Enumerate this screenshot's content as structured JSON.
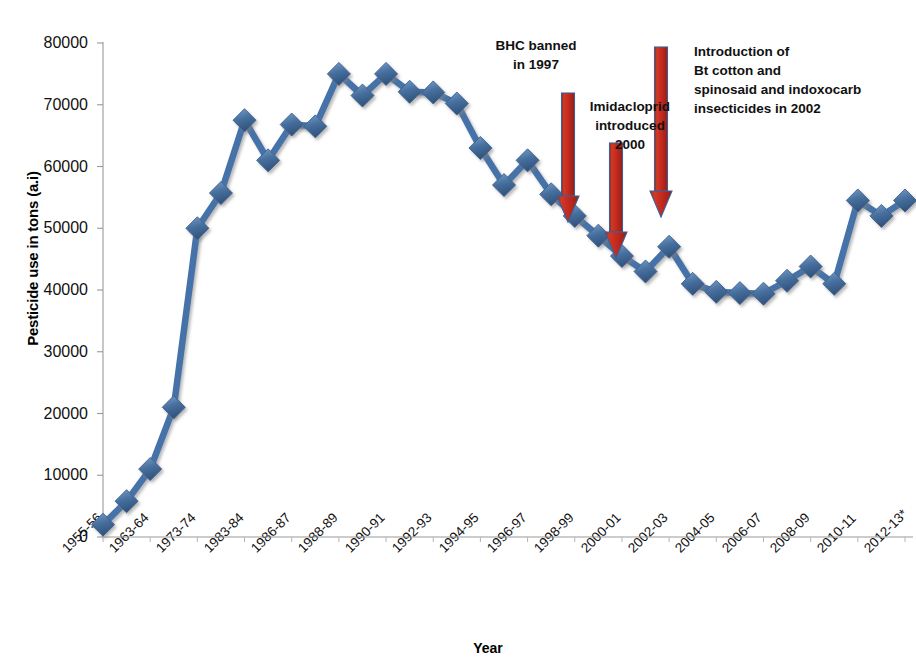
{
  "chart_data": {
    "type": "line",
    "title": "",
    "xlabel": "Year",
    "ylabel": "Pesticide use in tons (a.i)",
    "ylim": [
      0,
      80000
    ],
    "ytick_labels": [
      "0",
      "10000",
      "20000",
      "30000",
      "40000",
      "50000",
      "60000",
      "70000",
      "80000"
    ],
    "ytick_values": [
      0,
      10000,
      20000,
      30000,
      40000,
      50000,
      60000,
      70000,
      80000
    ],
    "grid": false,
    "legend": "none",
    "marker": "diamond",
    "series_color": "#4472a8",
    "categories": [
      "1955-56",
      "1960-61",
      "1963-64",
      "1968-69",
      "1973-74",
      "1978-79",
      "1983-84",
      "1985-86",
      "1986-87",
      "1987-88",
      "1988-89",
      "1989-90",
      "1990-91",
      "1991-92",
      "1992-93",
      "1993-94",
      "1994-95",
      "1995-96",
      "1996-97",
      "1997-98",
      "1998-99",
      "1999-2000",
      "2000-01",
      "2001-02",
      "2002-03",
      "2003-04",
      "2004-05",
      "2005-06",
      "2006-07",
      "2007-08",
      "2008-09",
      "2009-10",
      "2010-11",
      "2011-12",
      "2012-13*"
    ],
    "tick_categories": [
      "1955-56",
      "1963-64",
      "1973-74",
      "1983-84",
      "1986-87",
      "1988-89",
      "1990-91",
      "1992-93",
      "1994-95",
      "1996-97",
      "1998-99",
      "2000-01",
      "2002-03",
      "2004-05",
      "2006-07",
      "2008-09",
      "2010-11",
      "2012-13*"
    ],
    "values": [
      2000,
      5800,
      11000,
      21000,
      50000,
      55700,
      67500,
      61000,
      66800,
      66500,
      75000,
      71500,
      75000,
      72100,
      72000,
      70200,
      63000,
      57000,
      61000,
      55500,
      52000,
      48800,
      45500,
      43000,
      47000,
      41000,
      39700,
      39500,
      39400,
      41500,
      43800,
      41000,
      54500,
      52000,
      54500
    ]
  },
  "annotations": [
    {
      "id": "bhc-banned",
      "text": "BHC banned\nin 1997"
    },
    {
      "id": "imidacloprid",
      "text": "Imidacloprid\nintroduced\n2000"
    },
    {
      "id": "bt-cotton",
      "text": "Introduction of\nBt cotton and\nspinosaid and indoxocarb\ninsecticides in 2002"
    }
  ],
  "arrows": {
    "color": "#c0261f",
    "border": "#3a5f96",
    "count": 3
  }
}
